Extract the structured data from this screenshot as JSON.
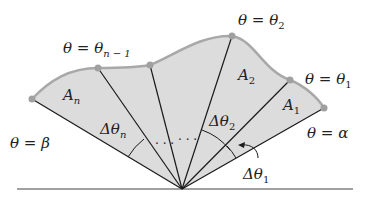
{
  "figure": {
    "type": "polar-region-partition",
    "colors": {
      "fill": "#dcdcdc",
      "boundary": "#a8a8a8",
      "rays": "#1a1a1a",
      "points": "#a0a0a0"
    },
    "labels": {
      "theta_beta": "θ = β",
      "theta_alpha": "θ = α",
      "theta_1": {
        "main": "θ = θ",
        "sub": "1"
      },
      "theta_2": {
        "main": "θ = θ",
        "sub": "2"
      },
      "theta_n_minus_1": {
        "main": "θ = θ",
        "sub": "n − 1"
      },
      "area_1": {
        "main": "A",
        "sub": "1"
      },
      "area_2": {
        "main": "A",
        "sub": "2"
      },
      "area_n": {
        "main": "A",
        "sub": "n"
      },
      "delta_theta_1": {
        "main": "Δθ",
        "sub": "1"
      },
      "delta_theta_2": {
        "main": "Δθ",
        "sub": "2"
      },
      "delta_theta_n": {
        "main": "Δθ",
        "sub": "n"
      },
      "ellipsis": "· · ·"
    }
  }
}
